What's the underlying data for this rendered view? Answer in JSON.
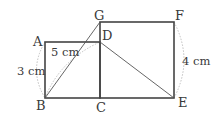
{
  "figure": {
    "type": "geometry-diagram",
    "points": {
      "A": {
        "label": "A",
        "x": 45,
        "y": 42
      },
      "B": {
        "label": "B",
        "x": 45,
        "y": 98
      },
      "C": {
        "label": "C",
        "x": 100,
        "y": 98
      },
      "D": {
        "label": "D",
        "x": 100,
        "y": 42
      },
      "G": {
        "label": "G",
        "x": 100,
        "y": 22
      },
      "F": {
        "label": "F",
        "x": 174,
        "y": 22
      },
      "E": {
        "label": "E",
        "x": 174,
        "y": 98
      }
    },
    "shapes": {
      "rectangle_ABCD": "ABCD",
      "square_GCEF": "GCEF"
    },
    "segments": [
      "BG",
      "BD",
      "DE"
    ],
    "measurements": {
      "AB": "3 cm",
      "BD": "5 cm",
      "EF": "4 cm"
    },
    "colors": {
      "stroke": "#444444",
      "arc": "#b8b8b8",
      "text": "#3a3a3a"
    }
  }
}
